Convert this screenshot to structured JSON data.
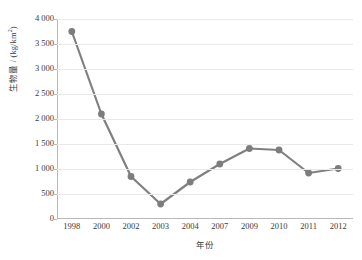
{
  "chart_data": {
    "type": "line",
    "title": "",
    "xlabel": "年份",
    "ylabel": "生物量 / (kg/km²)",
    "ylabel_parts": {
      "prefix": "生物量 / (kg/km",
      "superscript": "2",
      "suffix": ")"
    },
    "categories": [
      "1998",
      "2000",
      "2002",
      "2003",
      "2004",
      "2007",
      "2009",
      "2010",
      "2011",
      "2012"
    ],
    "values": [
      3750,
      2100,
      850,
      300,
      740,
      1100,
      1410,
      1380,
      920,
      1010
    ],
    "series": [
      {
        "name": "生物量",
        "values": [
          3750,
          2100,
          850,
          300,
          740,
          1100,
          1410,
          1380,
          920,
          1010
        ]
      }
    ],
    "ylim": [
      0,
      4000
    ],
    "ytick_values": [
      0,
      500,
      1000,
      1500,
      2000,
      2500,
      3000,
      3500,
      4000
    ],
    "ytick_labels": [
      "0",
      "500",
      "1 000",
      "1 500",
      "2 000",
      "2 500",
      "3 000",
      "3 500",
      "4 000"
    ],
    "grid": true,
    "grid_axis": "y",
    "legend": false,
    "legend_position": "none",
    "colors": {
      "series": "#808080",
      "marker": "#7d7d7d",
      "gridline": "#e9e9e9",
      "axis": "#b9b9b9",
      "text": "#3a3a3a",
      "background": "#ffffff"
    },
    "marker": {
      "shape": "circle",
      "radius": 3.4
    },
    "line_width": 2.2
  }
}
